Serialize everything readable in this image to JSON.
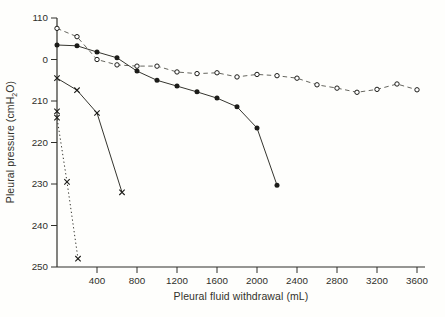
{
  "figure": {
    "colors": {
      "background": "#fefefc",
      "ink": "#2f2f2a",
      "dashed_line": "#55554d",
      "solid_line": "#35352f",
      "marker": "#1c1c19"
    }
  },
  "chart_data": {
    "type": "line",
    "title": "",
    "xlabel": "Pleural fluid withdrawal (mL)",
    "ylabel": "Pleural pressure (cmH2O)",
    "ylabel_parts": {
      "pre": "Pleural pressure (cmH",
      "sub": "2",
      "post": "O)"
    },
    "xlim": [
      0,
      3680
    ],
    "ylim": [
      -50,
      10
    ],
    "grid": false,
    "legend": false,
    "x_ticks": {
      "values": [
        400,
        800,
        1200,
        1600,
        2000,
        2400,
        2800,
        3200,
        3600
      ],
      "labels": [
        "400",
        "800",
        "1200",
        "1600",
        "2000",
        "2400",
        "2800",
        "3200",
        "3600"
      ]
    },
    "y_ticks": {
      "values": [
        10,
        0,
        -10,
        -20,
        -30,
        -40,
        -50
      ],
      "labels": [
        "110",
        "0",
        "210",
        "220",
        "230",
        "240",
        "250"
      ]
    },
    "series": [
      {
        "name": "slow-decline-open-circles",
        "marker": "open-circle",
        "line": "dashed",
        "points": [
          [
            0,
            7.5
          ],
          [
            200,
            5.5
          ],
          [
            400,
            0
          ],
          [
            600,
            -1.3
          ],
          [
            800,
            -1.6
          ],
          [
            1000,
            -1.6
          ],
          [
            1200,
            -3
          ],
          [
            1400,
            -3.4
          ],
          [
            1600,
            -3.2
          ],
          [
            1800,
            -4.2
          ],
          [
            2000,
            -3.6
          ],
          [
            2200,
            -3.9
          ],
          [
            2400,
            -4.5
          ],
          [
            2600,
            -6.1
          ],
          [
            2800,
            -6.9
          ],
          [
            3000,
            -7.9
          ],
          [
            3200,
            -7.2
          ],
          [
            3400,
            -5.9
          ],
          [
            3600,
            -7.3
          ]
        ]
      },
      {
        "name": "moderate-decline-filled-circles",
        "marker": "filled-circle",
        "line": "solid",
        "points": [
          [
            0,
            3.5
          ],
          [
            200,
            3.3
          ],
          [
            400,
            1.8
          ],
          [
            600,
            0.4
          ],
          [
            800,
            -2.8
          ],
          [
            1000,
            -5
          ],
          [
            1200,
            -6.4
          ],
          [
            1400,
            -7.8
          ],
          [
            1600,
            -9.3
          ],
          [
            1800,
            -11.4
          ],
          [
            2000,
            -16.5
          ],
          [
            2200,
            -30.3
          ]
        ]
      },
      {
        "name": "steep-decline-x-solid",
        "marker": "x",
        "line": "solid",
        "points": [
          [
            0,
            -4.5
          ],
          [
            200,
            -7.4
          ],
          [
            400,
            -12.9
          ],
          [
            650,
            -32
          ]
        ]
      },
      {
        "name": "very-steep-decline-x-dotted",
        "marker": "x",
        "line": "dotted",
        "points": [
          [
            0,
            -12.5
          ],
          [
            0,
            -14
          ],
          [
            100,
            -29.5
          ],
          [
            210,
            -48
          ]
        ]
      }
    ]
  }
}
